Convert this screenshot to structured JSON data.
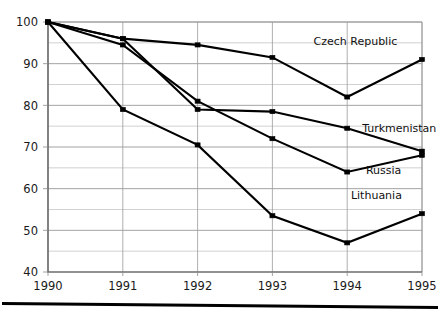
{
  "chart_data": {
    "type": "line",
    "title": "",
    "subtitle": "",
    "xlabel": "",
    "ylabel": "",
    "x": [
      1990,
      1991,
      1992,
      1993,
      1994,
      1995
    ],
    "categories": [
      "1990",
      "1991",
      "1992",
      "1993",
      "1994",
      "1995"
    ],
    "xlim": [
      1990,
      1995
    ],
    "ylim": [
      40,
      100
    ],
    "y_ticks": [
      40,
      50,
      60,
      70,
      80,
      90,
      100
    ],
    "y_tick_labels": [
      "40",
      "50",
      "60",
      "70",
      "80",
      "90",
      "100"
    ],
    "y_minor_ticks": [
      45,
      55,
      65,
      75,
      85,
      95
    ],
    "grid": "both",
    "legend_position": "inline-right-of-series",
    "series": [
      {
        "name": "Czech Republic",
        "label": "Czech Republic",
        "color": "#000000",
        "marker": "square",
        "values": [
          100,
          96,
          94.5,
          91.5,
          82,
          91
        ],
        "label_x": 1993.55,
        "label_y": 94.5
      },
      {
        "name": "Turkmenistan",
        "label": "Turkmenistan",
        "color": "#000000",
        "marker": "square",
        "values": [
          100,
          94.5,
          81,
          72,
          64,
          68
        ],
        "label_x": 1994.2,
        "label_y": 73.5
      },
      {
        "name": "Russia",
        "label": "Russia",
        "color": "#000000",
        "marker": "square",
        "values": [
          100,
          96,
          79,
          78.5,
          74.5,
          69
        ],
        "label_x": 1994.25,
        "label_y": 63.5
      },
      {
        "name": "Lithuania",
        "label": "Lithuania",
        "color": "#000000",
        "marker": "square",
        "values": [
          100,
          79,
          70.5,
          53.5,
          47,
          54
        ],
        "label_x": 1994.05,
        "label_y": 57.5
      }
    ],
    "annotations": [
      {
        "text": "Czech Republic",
        "series": "Czech Republic"
      },
      {
        "text": "Turkmenistan",
        "series": "Turkmenistan"
      },
      {
        "text": "Russia",
        "series": "Russia"
      },
      {
        "text": "Lithuania",
        "series": "Lithuania"
      }
    ]
  },
  "axes": {
    "y_labels": [
      "100",
      "90",
      "80",
      "70",
      "60",
      "50",
      "40"
    ],
    "x_labels": [
      "1990",
      "1991",
      "1992",
      "1993",
      "1994",
      "1995"
    ]
  },
  "labels": {
    "czech": "Czech Republic",
    "turkmenistan": "Turkmenistan",
    "russia": "Russia",
    "lithuania": "Lithuania"
  },
  "colors": {
    "line": "#000000",
    "grid_major": "#8c8c8c",
    "grid_minor": "#bdbdbd",
    "axis": "#6e6e6e",
    "text": "#1a1a1a",
    "background": "#ffffff"
  }
}
